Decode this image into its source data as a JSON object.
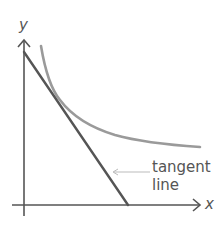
{
  "diagram": {
    "title": "",
    "axes": {
      "x_label": "x",
      "y_label": "y"
    },
    "annotation": {
      "line1": "tangent",
      "line2": "line"
    },
    "elements": {
      "curve": "decreasing convex curve (hyperbola-like)",
      "tangent_line": "straight line tangent to the curve",
      "pointer": "arrow pointing left from label to tangent line"
    },
    "colors": {
      "axes": "#555555",
      "tangent_line": "#555555",
      "curve": "#9a9a9a",
      "pointer": "#bbbbbb",
      "text": "#555555"
    }
  }
}
